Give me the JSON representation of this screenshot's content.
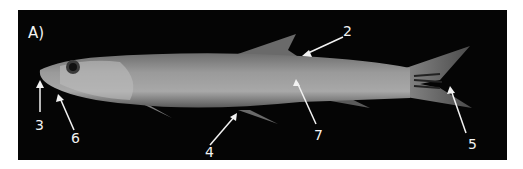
{
  "figure": {
    "panel_label": "A)",
    "background_color": "#050505",
    "annotations": [
      {
        "number": "2",
        "target": "dorsal fin base"
      },
      {
        "number": "3",
        "target": "snout tip"
      },
      {
        "number": "4",
        "target": "pelvic fin base"
      },
      {
        "number": "5",
        "target": "caudal fin rays"
      },
      {
        "number": "6",
        "target": "lower jaw"
      },
      {
        "number": "7",
        "target": "lateral body"
      }
    ]
  }
}
